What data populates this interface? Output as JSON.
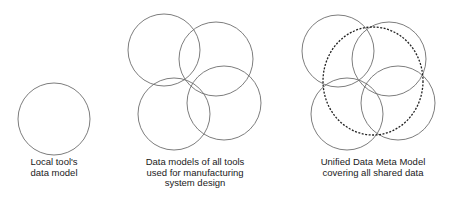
{
  "colors": {
    "circle_stroke": "#6e6e6e",
    "dashed_stroke": "#222222",
    "text": "#1a1a1a"
  },
  "panels": [
    {
      "id": "local",
      "caption_lines": [
        "Local tool's",
        "data model"
      ],
      "circles": [
        {
          "cx": 54,
          "cy": 119,
          "r": 36
        }
      ]
    },
    {
      "id": "all-tools",
      "caption_lines": [
        "Data models of all tools",
        "used for manufacturing",
        "system design"
      ],
      "circles": [
        {
          "cx": 164,
          "cy": 50,
          "r": 36
        },
        {
          "cx": 216,
          "cy": 59,
          "r": 37
        },
        {
          "cx": 174,
          "cy": 114,
          "r": 36
        },
        {
          "cx": 224,
          "cy": 103,
          "r": 37
        }
      ]
    },
    {
      "id": "unified",
      "caption_lines": [
        "Unified Data Meta Model",
        "covering all shared data"
      ],
      "circles": [
        {
          "cx": 338,
          "cy": 51,
          "r": 36
        },
        {
          "cx": 389,
          "cy": 59,
          "r": 37
        },
        {
          "cx": 347,
          "cy": 114,
          "r": 36
        },
        {
          "cx": 398,
          "cy": 103,
          "r": 37
        }
      ],
      "dashed_ellipse": {
        "cx": 373,
        "cy": 81,
        "rx": 50,
        "ry": 54
      }
    }
  ]
}
